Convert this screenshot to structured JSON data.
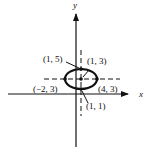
{
  "diagram": {
    "type": "ellipse-on-coordinate-axes",
    "axes": {
      "x_label": "x",
      "y_label": "y"
    },
    "ellipse": {
      "center": "(1, 3)",
      "vertices": [
        "(-2, 3)",
        "(4, 3)"
      ],
      "co_vertices": [
        "(1, 5)",
        "(1, 1)"
      ]
    },
    "labels": {
      "top": "(1, 5)",
      "center": "(1, 3)",
      "left": "(−2, 3)",
      "right": "(4, 3)",
      "bottom": "(1, 1)"
    },
    "colors": {
      "ink": "#111111",
      "background": "#ffffff"
    }
  }
}
